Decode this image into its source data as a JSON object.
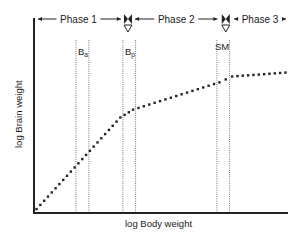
{
  "chart_data": {
    "type": "line",
    "title": "",
    "xlabel": "log Body weight",
    "ylabel": "log Brain weight",
    "grid": false,
    "xlim": [
      0,
      100
    ],
    "ylim": [
      0,
      100
    ],
    "series": [
      {
        "name": "brain-body growth curve",
        "style": "dotted",
        "x": [
          1,
          34,
          39,
          73,
          78,
          99
        ],
        "y": [
          2,
          49,
          53,
          67,
          70,
          72
        ]
      }
    ],
    "phases": [
      {
        "label": "Phase 1",
        "x_start": 0,
        "x_end": 35
      },
      {
        "label": "Phase 2",
        "x_start": 39,
        "x_end": 73
      },
      {
        "label": "Phase 3",
        "x_start": 78,
        "x_end": 100
      }
    ],
    "transition_markers": [
      {
        "x": 37,
        "label": ""
      },
      {
        "x": 75.5,
        "label": "SM"
      }
    ],
    "vertical_bands": [
      {
        "label": "Ba",
        "label_main": "B",
        "label_sub": "a",
        "x1": 16.5,
        "x2": 21.6
      },
      {
        "label": "Bp",
        "label_main": "B",
        "label_sub": "p",
        "x1": 35,
        "x2": 40
      },
      {
        "label": "SM",
        "label_main": "SM",
        "label_sub": "",
        "x1": 72,
        "x2": 77
      }
    ]
  }
}
